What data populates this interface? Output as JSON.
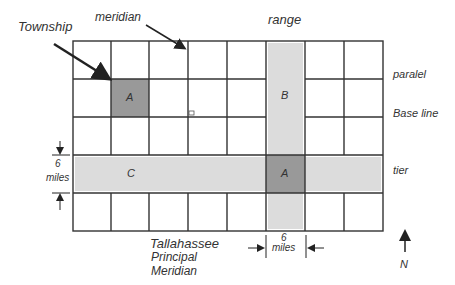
{
  "labels": {
    "township": "Township",
    "meridian": "meridian",
    "range": "range",
    "parallel": "paralel",
    "base_line": "Base line",
    "tier": "tier",
    "six": "6",
    "miles": "miles",
    "six_bottom": "6",
    "miles_bottom": "miles",
    "principal_meridian_1": "Tallahassee",
    "principal_meridian_2": "Principal",
    "principal_meridian_3": "Meridian",
    "north": "N"
  },
  "cells": {
    "a_top": "A",
    "b": "B",
    "c": "C",
    "a_center": "A"
  },
  "colors": {
    "dark_cell": "#999999",
    "light_strip": "#dcdcdc",
    "grid_line": "#333333"
  },
  "grid": {
    "columns": 8,
    "rows": 5
  }
}
